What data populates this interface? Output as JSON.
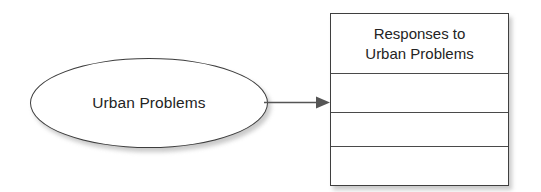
{
  "diagram": {
    "colors": {
      "text": "#242424",
      "border": "#3f3f3f",
      "divider": "#4a4a4a",
      "fill": "#ffffff",
      "shadow": "#bdbdbd",
      "connector": "#555555"
    },
    "source_node": {
      "shape": "ellipse",
      "label": "Urban Problems"
    },
    "connector": {
      "type": "arrow",
      "direction": "left-to-right",
      "label": ""
    },
    "target_node": {
      "shape": "table",
      "header": "Responses to\nUrban Problems",
      "header_line_1": "Responses to",
      "header_line_2": "Urban Problems",
      "rows": [
        "",
        "",
        ""
      ],
      "row_count": 3
    }
  }
}
